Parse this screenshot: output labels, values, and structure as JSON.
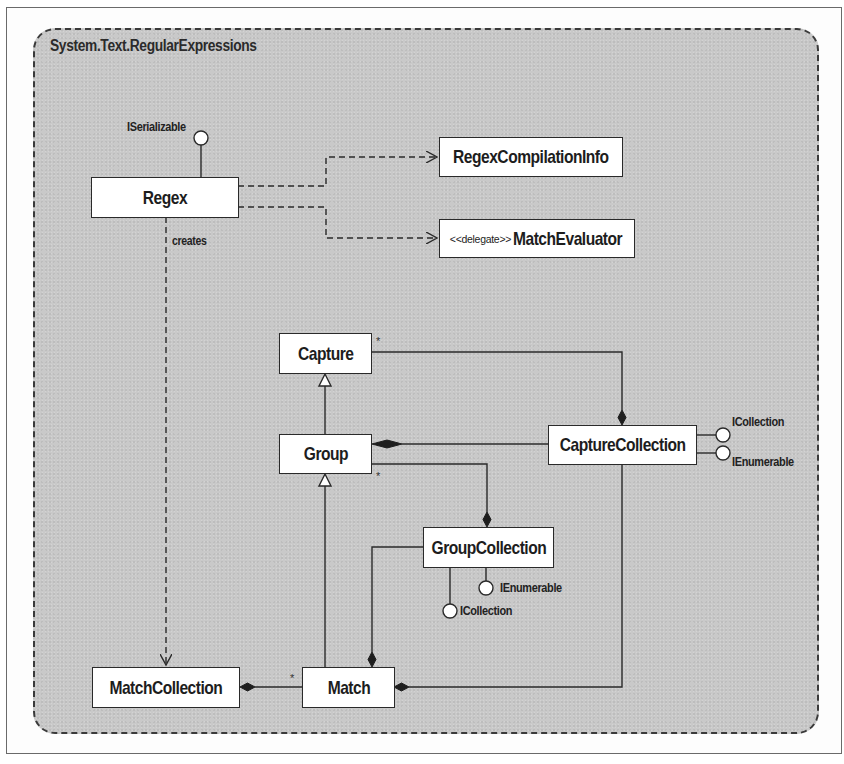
{
  "package": {
    "title": "System.Text.RegularExpressions"
  },
  "classes": {
    "regex": {
      "name": "Regex"
    },
    "regex_compilation_info": {
      "name": "RegexCompilationInfo"
    },
    "match_evaluator": {
      "stereotype": "<<delegate>>",
      "name": "MatchEvaluator"
    },
    "capture": {
      "name": "Capture"
    },
    "group": {
      "name": "Group"
    },
    "capture_collection": {
      "name": "CaptureCollection"
    },
    "group_collection": {
      "name": "GroupCollection"
    },
    "match_collection": {
      "name": "MatchCollection"
    },
    "match": {
      "name": "Match"
    }
  },
  "interfaces": {
    "regex_iserializable": "ISerializable",
    "capture_collection_icollection": "ICollection",
    "capture_collection_ienumerable": "IEnumerable",
    "group_collection_ienumerable": "IEnumerable",
    "group_collection_icollection": "ICollection"
  },
  "relations": {
    "creates_label": "creates",
    "capture_multiplicity": "*",
    "group_multiplicity": "*",
    "match_multiplicity": "*"
  },
  "colors": {
    "package_fill": "#c9c9c9",
    "line": "#2a2a2a",
    "box_fill": "#ffffff"
  }
}
